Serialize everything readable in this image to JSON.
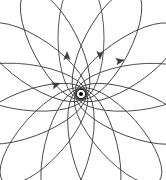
{
  "figure": {
    "background_color": "#ffffff",
    "curve_color": "#3c3c3c",
    "center_marker_color": "#000000",
    "center_marker_ring_color": "#ffffff",
    "watermark_text": "",
    "center_label": "focus"
  },
  "chart_data": {
    "type": "line",
    "subtitle": "",
    "xlabel": "",
    "ylabel": "",
    "grid": false,
    "legend": false,
    "axis_visible": false,
    "xlim": [
      0,
      166
    ],
    "ylim": [
      0,
      180
    ],
    "center": {
      "x": 81,
      "y": 94
    },
    "orbit": {
      "description": "Family of congruent ellipses sharing one focus at the center, each successively rotated by a constant precession angle",
      "ellipse_count": 13,
      "semi_major_axis": 61,
      "semi_minor_axis": 23,
      "focus_offset": 56,
      "start_angle_deg": -90,
      "precession_step_deg": 27.7,
      "rotation_sense": "clockwise"
    },
    "annotations": [
      {
        "name": "upward-arrow-left-branch",
        "x": 67,
        "y": 57,
        "angle_deg": -90,
        "meaning": "direction of motion outbound on the vertical loop"
      },
      {
        "name": "downward-arrow-right-branch",
        "x": 100,
        "y": 54,
        "angle_deg": 90,
        "meaning": "direction of motion inbound on the vertical loop"
      },
      {
        "name": "rightward-arrow-upper-right-loop",
        "x": 119,
        "y": 61,
        "angle_deg": -12,
        "meaning": "direction of motion on the upper-right loop"
      },
      {
        "name": "rightward-arrow-left-loop",
        "x": 55,
        "y": 85,
        "angle_deg": -18,
        "meaning": "direction of motion on the left loop"
      }
    ]
  }
}
